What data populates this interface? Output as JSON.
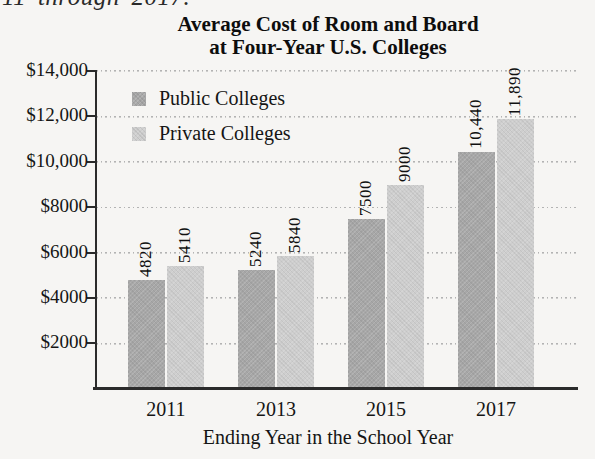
{
  "page_fragment": "11 through 2017.",
  "chart_data": {
    "type": "bar",
    "title": "Average Cost of Room and Board at Four-Year U.S. Colleges",
    "title_lines": [
      "Average Cost of Room and Board",
      "at Four-Year U.S. Colleges"
    ],
    "categories": [
      "2011",
      "2013",
      "2015",
      "2017"
    ],
    "series": [
      {
        "name": "Public Colleges",
        "color": "#a7a7a7",
        "values": [
          4820,
          5240,
          7500,
          10440
        ],
        "labels": [
          "4820",
          "5240",
          "7500",
          "10,440"
        ]
      },
      {
        "name": "Private Colleges",
        "color": "#cecece",
        "values": [
          5410,
          5840,
          9000,
          11890
        ],
        "labels": [
          "5410",
          "5840",
          "9000",
          "11,890"
        ]
      }
    ],
    "xlabel": "Ending Year in the School Year",
    "ylabel": "",
    "ylim": [
      0,
      14000
    ],
    "ytick_step": 2000,
    "ytick_labels": [
      "$2000",
      "$4000",
      "$6000",
      "$8000",
      "$10,000",
      "$12,000",
      "$14,000"
    ],
    "grid": "dotted horizontal",
    "legend_position": "upper-left-inside",
    "axis_color": "#2b2b2b",
    "gridline_color": "#b3b3b3"
  }
}
